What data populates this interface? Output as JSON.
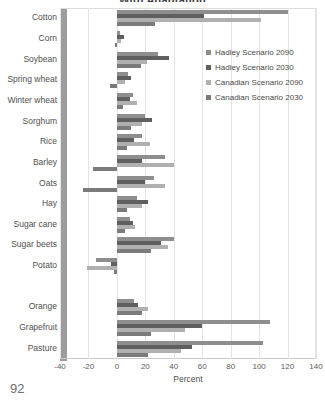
{
  "folio": "92",
  "chart_data": {
    "type": "bar",
    "orientation": "horizontal",
    "title": "With Adaptation",
    "xlabel": "Percent",
    "ylabel": "",
    "xlim": [
      -40,
      140
    ],
    "xticks": [
      -40,
      -20,
      0,
      20,
      40,
      60,
      80,
      100,
      120,
      140
    ],
    "grid": true,
    "legend_position": "upper right",
    "categories": [
      "Cotton",
      "Corn",
      "Soybean",
      "Spring wheat",
      "Winter wheat",
      "Sorghum",
      "Rice",
      "Barley",
      "Oats",
      "Hay",
      "Sugar cane",
      "Sugar beets",
      "Potato",
      "",
      "Orange",
      "Grapefruit",
      "Pasture"
    ],
    "series": [
      {
        "name": "Hadley Scenario 2090",
        "color": "#8e8e8e",
        "values": [
          120,
          2,
          29,
          8,
          11,
          20,
          18,
          34,
          26,
          14,
          9,
          40,
          -15,
          null,
          12,
          108,
          103
        ]
      },
      {
        "name": "Hadley Scenario 2030",
        "color": "#5f5f5f",
        "values": [
          61,
          5,
          37,
          10,
          9,
          25,
          12,
          18,
          20,
          22,
          11,
          31,
          -4,
          null,
          15,
          60,
          53
        ]
      },
      {
        "name": "Canadian Scenario 2090",
        "color": "#b0b0b0",
        "values": [
          101,
          3,
          21,
          6,
          14,
          18,
          23,
          40,
          34,
          18,
          13,
          36,
          -21,
          null,
          22,
          48,
          45
        ]
      },
      {
        "name": "Canadian Scenario 2030",
        "color": "#7b7b7b",
        "values": [
          27,
          -1,
          17,
          -5,
          4,
          10,
          7,
          -17,
          -24,
          7,
          6,
          24,
          -2,
          null,
          18,
          24,
          22
        ]
      }
    ],
    "legend": [
      "Hadley Scenario 2090",
      "Hadley Scenario 2030",
      "Canadian Scenario 2090",
      "Canadian Scenario 2030"
    ]
  }
}
